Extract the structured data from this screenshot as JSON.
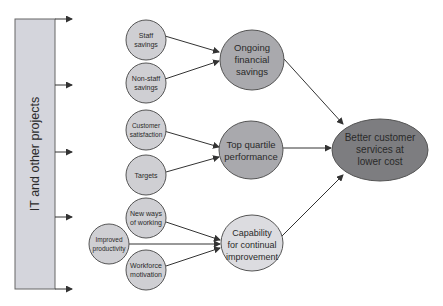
{
  "diagram": {
    "source_box": {
      "label": "IT and other projects",
      "fill": "#d4d5dc"
    },
    "small_nodes": [
      {
        "id": "staff",
        "lines": [
          "Staff",
          "savings"
        ]
      },
      {
        "id": "nonstaff",
        "lines": [
          "Non-staff",
          "savings"
        ]
      },
      {
        "id": "custsat",
        "lines": [
          "Customer",
          "satisfaction"
        ]
      },
      {
        "id": "targets",
        "lines": [
          "Targets"
        ]
      },
      {
        "id": "newways",
        "lines": [
          "New ways",
          "of working"
        ]
      },
      {
        "id": "improved",
        "lines": [
          "Improved",
          "productivity"
        ]
      },
      {
        "id": "workforce",
        "lines": [
          "Workforce",
          "motivation"
        ]
      }
    ],
    "mid_nodes": [
      {
        "id": "ongoing",
        "lines": [
          "Ongoing",
          "financial",
          "savings"
        ]
      },
      {
        "id": "topq",
        "lines": [
          "Top quartile",
          "performance"
        ]
      },
      {
        "id": "capability",
        "lines": [
          "Capability",
          "for continual",
          "improvement"
        ]
      }
    ],
    "final_node": {
      "id": "better",
      "lines": [
        "Better customer",
        "services at",
        "lower cost"
      ]
    },
    "colors": {
      "small_fill": "#cfcfd3",
      "ongoing_fill": "#a9a9ad",
      "topq_fill": "#a9a9ad",
      "capability_fill": "#dcdce0",
      "final_fill": "#7d7d80",
      "stroke": "#555555"
    }
  }
}
